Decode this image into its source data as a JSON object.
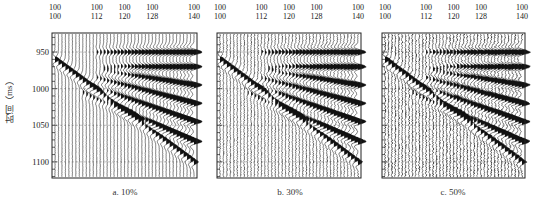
{
  "chart_data": {
    "type": "seismic-wiggle",
    "ylabel": "时间（ms）",
    "yticks": [
      950,
      1000,
      1050,
      1100
    ],
    "ylim": [
      924,
      1122
    ],
    "top_axis": {
      "row1": [
        "100",
        "100",
        "100",
        "100",
        "100"
      ],
      "row2": [
        "100",
        "112",
        "120",
        "128",
        "140"
      ],
      "positions": [
        100,
        112,
        120,
        128,
        140
      ],
      "xlim": [
        100,
        140
      ]
    },
    "panels": [
      {
        "id": "a",
        "caption": "a. 10%",
        "noise_level": 0.1
      },
      {
        "id": "b",
        "caption": "b. 30%",
        "noise_level": 0.3
      },
      {
        "id": "c",
        "caption": "c. 50%",
        "noise_level": 0.5
      }
    ],
    "events": [
      {
        "name": "diagonal",
        "t_left": 960,
        "t_right": 1100,
        "x_start": 100,
        "x_end": 140
      },
      {
        "name": "fan1",
        "t_left": 950,
        "t_right": 950,
        "x_start": 112,
        "x_end": 140
      },
      {
        "name": "fan2",
        "t_left": 970,
        "t_right": 970,
        "x_start": 114,
        "x_end": 140
      },
      {
        "name": "fan3",
        "t_left": 975,
        "t_right": 995,
        "x_start": 114,
        "x_end": 140
      },
      {
        "name": "fan4",
        "t_left": 985,
        "t_right": 1020,
        "x_start": 112,
        "x_end": 140
      },
      {
        "name": "fan5",
        "t_left": 995,
        "t_right": 1045,
        "x_start": 110,
        "x_end": 140
      },
      {
        "name": "fan6",
        "t_left": 1005,
        "t_right": 1072,
        "x_start": 108,
        "x_end": 140
      }
    ],
    "traces_per_panel": 41,
    "grid": "dashed horizontal at yticks"
  },
  "colors": {
    "ink": "#111111",
    "axis": "#222222",
    "grid": "#999999"
  }
}
